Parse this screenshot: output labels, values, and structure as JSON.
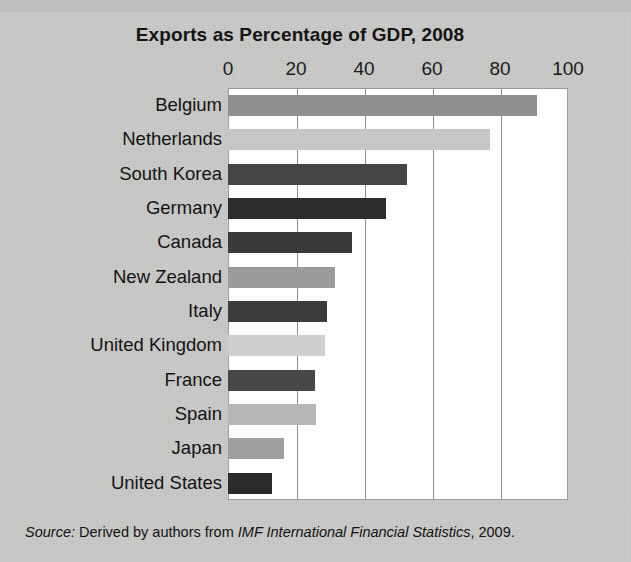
{
  "chart_data": {
    "type": "bar",
    "orientation": "horizontal",
    "title": "Exports as Percentage of GDP, 2008",
    "xlabel": "",
    "ylabel": "",
    "xlim": [
      0,
      100
    ],
    "xticks": [
      0,
      20,
      40,
      60,
      80,
      100
    ],
    "xtick_labels": [
      "0",
      "20",
      "40",
      "60",
      "80",
      "100"
    ],
    "grid": "vertical",
    "legend": "none",
    "categories": [
      "Belgium",
      "Netherlands",
      "South Korea",
      "Germany",
      "Canada",
      "New Zealand",
      "Italy",
      "United Kingdom",
      "France",
      "Spain",
      "Japan",
      "United States"
    ],
    "values": [
      91,
      77,
      52.5,
      46.5,
      36.5,
      31.5,
      29,
      28.5,
      25.5,
      26,
      16.5,
      13
    ],
    "bar_colors": [
      "#8f8f8f",
      "#c6c6c6",
      "#454545",
      "#2c2c2c",
      "#3a3a3a",
      "#9b9b9b",
      "#3c3c3c",
      "#cfcfcf",
      "#474747",
      "#b6b6b6",
      "#9f9f9f",
      "#2b2b2b"
    ],
    "source": {
      "label": "Source:",
      "text_before": "Derived by authors from",
      "publication": "IMF International Financial Statistics",
      "text_after": ", 2009."
    }
  },
  "colors": {
    "page_background": "#cacac8",
    "plot_background": "#fdfdfd",
    "gridline": "#8e8e8c",
    "text": "#131313"
  }
}
